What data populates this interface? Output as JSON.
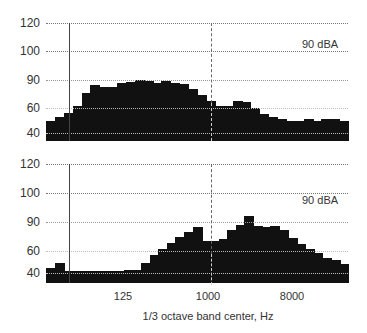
{
  "chart_data": [
    {
      "type": "bar",
      "title": "",
      "annotation": "90 dBA",
      "ylabel": "",
      "xlabel": "1/3 octave band center, Hz",
      "yticks": [
        "120",
        "100",
        "90",
        "60",
        "40"
      ],
      "xticks": [
        "125",
        "1000",
        "8000"
      ],
      "grid": true,
      "note": "Stepped 1/3-octave spectrum; y-axis ticks equally spaced; values approximate dB",
      "values": [
        50,
        53,
        56,
        62,
        76,
        85,
        82,
        82,
        87,
        88,
        90,
        89,
        87,
        89,
        87,
        86,
        80,
        74,
        67,
        62,
        62,
        68,
        66,
        60,
        55,
        53,
        51,
        50,
        50,
        51,
        50,
        51,
        51,
        50
      ]
    },
    {
      "type": "bar",
      "title": "",
      "annotation": "90 dBA",
      "ylabel": "",
      "xlabel": "1/3 octave band center, Hz",
      "yticks": [
        "120",
        "100",
        "90",
        "60",
        "40"
      ],
      "xticks": [
        "125",
        "1000",
        "8000"
      ],
      "grid": true,
      "values": [
        45,
        49,
        42,
        42,
        42,
        42,
        42,
        42,
        42,
        43,
        43,
        49,
        56,
        62,
        68,
        74,
        80,
        85,
        70,
        70,
        72,
        82,
        87,
        92,
        86,
        85,
        86,
        82,
        73,
        67,
        62,
        58,
        54,
        52,
        48
      ]
    }
  ],
  "labels": {
    "annotation": "90 dBA",
    "xlabel": "1/3 octave band center, Hz",
    "yticks": [
      "120",
      "100",
      "90",
      "60",
      "40"
    ],
    "xticks": [
      "125",
      "1000",
      "8000"
    ]
  },
  "colors": {
    "bar": "#111111",
    "grid": "#777777",
    "text": "#333333"
  }
}
